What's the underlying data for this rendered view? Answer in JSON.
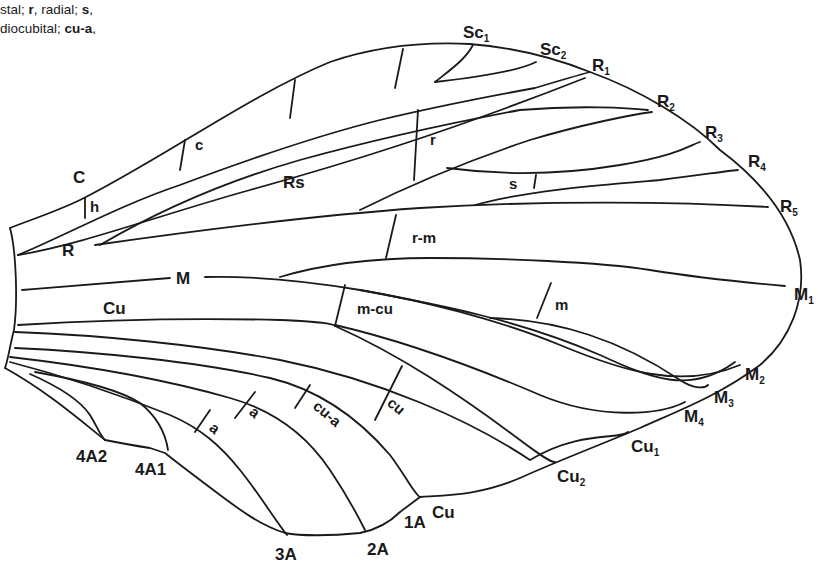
{
  "caption": {
    "line1": [
      {
        "text": "stal; ",
        "bold": false
      },
      {
        "text": "r",
        "bold": true
      },
      {
        "text": ",  radial; ",
        "bold": false
      },
      {
        "text": "s",
        "bold": true
      },
      {
        "text": ",",
        "bold": false
      }
    ],
    "line2": [
      {
        "text": "diocubital; ",
        "bold": false
      },
      {
        "text": "cu-a",
        "bold": true
      },
      {
        "text": ",",
        "bold": false
      }
    ]
  },
  "diagram": {
    "stroke_color": "#1a1a1a",
    "background": "#ffffff",
    "vein_labels": {
      "C": "C",
      "h": "h",
      "R": "R",
      "M": "M",
      "Cu": "Cu",
      "Rs": "Rs",
      "c": "c",
      "r": "r",
      "s": "s",
      "r_m": "r-m",
      "m_cu": "m-cu",
      "m": "m",
      "cu": "cu",
      "cu_a": "cu-a",
      "a1": "a",
      "a2": "a"
    },
    "margin_labels": {
      "Sc1": {
        "base": "Sc",
        "sub": "1"
      },
      "Sc2": {
        "base": "Sc",
        "sub": "2"
      },
      "R1": {
        "base": "R",
        "sub": "1"
      },
      "R2": {
        "base": "R",
        "sub": "2"
      },
      "R3": {
        "base": "R",
        "sub": "3"
      },
      "R4": {
        "base": "R",
        "sub": "4"
      },
      "R5": {
        "base": "R",
        "sub": "5"
      },
      "M1": {
        "base": "M",
        "sub": "1"
      },
      "M2": {
        "base": "M",
        "sub": "2"
      },
      "M3": {
        "base": "M",
        "sub": "3"
      },
      "M4": {
        "base": "M",
        "sub": "4"
      },
      "Cu1": {
        "base": "Cu",
        "sub": "1"
      },
      "Cu2": {
        "base": "Cu",
        "sub": "2"
      },
      "Cu_end": {
        "base": "Cu",
        "sub": ""
      },
      "A1": {
        "base": "1A",
        "sub": ""
      },
      "A2": {
        "base": "2A",
        "sub": ""
      },
      "A3": {
        "base": "3A",
        "sub": ""
      },
      "A4_1": {
        "base": "4A1",
        "sub": ""
      },
      "A4_2": {
        "base": "4A2",
        "sub": ""
      }
    }
  }
}
